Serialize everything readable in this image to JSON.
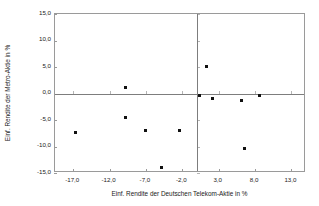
{
  "chart_data": {
    "type": "scatter",
    "title": "",
    "xlabel": "Einf. Rendite der Deutschen Telekom-Aktie in %",
    "ylabel": "Einf. Rendite der Metro-Aktie in %",
    "xlim": [
      -19.5,
      15.0
    ],
    "ylim": [
      -15.0,
      15.0
    ],
    "grid": false,
    "legend": null,
    "xticks": [
      -17.0,
      -12.0,
      -7.0,
      -2.0,
      3.0,
      8.0,
      13.0
    ],
    "xticklabels": [
      "-17,0",
      "-12,0",
      "-7,0",
      "-2,0",
      "3,0",
      "8,0",
      "13,0"
    ],
    "yticks": [
      15.0,
      10.0,
      5.0,
      0.0,
      -5.0,
      -10.0,
      -15.0
    ],
    "yticklabels": [
      "15,0",
      "10,0",
      "5,0",
      "0,0",
      "-5,0",
      "-10,0",
      "-15,0"
    ],
    "zero_lines": {
      "horizontal": 0.0,
      "vertical": 0.0
    },
    "marker": {
      "shape": "square",
      "color": "#111111",
      "size": 3
    },
    "series": [
      {
        "name": "Renditepaare",
        "points": [
          {
            "x": -16.7,
            "y": -7.3
          },
          {
            "x": -9.8,
            "y": 1.2
          },
          {
            "x": -9.8,
            "y": -4.5
          },
          {
            "x": -7.0,
            "y": -7.0
          },
          {
            "x": -4.8,
            "y": -13.9
          },
          {
            "x": -2.4,
            "y": -6.9
          },
          {
            "x": 0.3,
            "y": -0.3
          },
          {
            "x": 1.3,
            "y": 5.1
          },
          {
            "x": 2.2,
            "y": -1.0
          },
          {
            "x": 6.1,
            "y": -1.3
          },
          {
            "x": 6.6,
            "y": -10.3
          },
          {
            "x": 8.6,
            "y": -0.3
          }
        ]
      }
    ]
  },
  "axes": {
    "y_title": "Einf. Rendite der Metro-Aktie in %",
    "x_title": "Einf. Rendite der Deutschen Telekom-Aktie in %"
  }
}
